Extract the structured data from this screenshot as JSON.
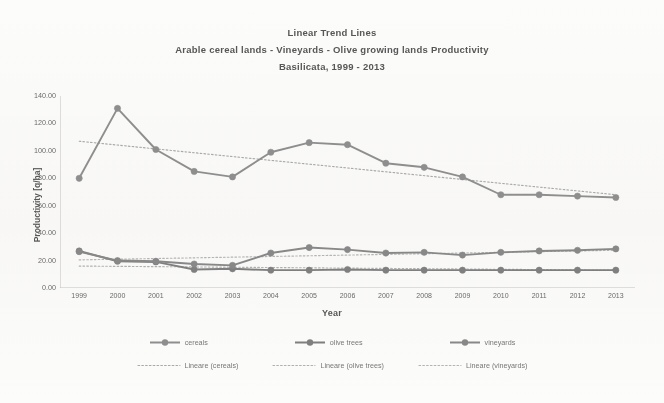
{
  "chart_data": {
    "type": "line",
    "title": "Linear Trend Lines",
    "subtitle_1": "Arable cereal lands - Vineyards - Olive growing lands Productivity",
    "subtitle_2": "Basilicata, 1999 - 2013",
    "xlabel": "Year",
    "ylabel": "Productivity  [q/ha]",
    "grid": false,
    "legend_position": "bottom",
    "ylim": [
      0,
      140
    ],
    "yticks": [
      0,
      20,
      40,
      60,
      80,
      100,
      120,
      140
    ],
    "ytick_labels": [
      "0.00",
      "20.00",
      "40.00",
      "60.00",
      "80.00",
      "100.00",
      "120.00",
      "140.00"
    ],
    "categories": [
      "1999",
      "2000",
      "2001",
      "2002",
      "2003",
      "2004",
      "2005",
      "2006",
      "2007",
      "2008",
      "2009",
      "2010",
      "2011",
      "2012",
      "2013"
    ],
    "series": [
      {
        "name": "cereals",
        "color": "#8e8e8e",
        "values": [
          80.0,
          131.0,
          101.0,
          85.0,
          81.0,
          99.0,
          106.0,
          104.5,
          91.0,
          88.0,
          81.0,
          68.0,
          68.0,
          67.0,
          66.0
        ]
      },
      {
        "name": "olive trees",
        "color": "#7f7f7f",
        "values": [
          27.0,
          19.5,
          19.0,
          13.5,
          14.0,
          13.0,
          13.0,
          13.5,
          13.0,
          13.0,
          13.0,
          13.0,
          13.0,
          13.0,
          13.0
        ]
      },
      {
        "name": "vineyards",
        "color": "#888888",
        "values": [
          26.5,
          20.0,
          19.5,
          17.5,
          16.5,
          25.5,
          29.5,
          28.0,
          25.5,
          26.0,
          24.0,
          26.0,
          27.0,
          27.5,
          28.5
        ]
      }
    ],
    "trendlines": [
      {
        "name": "Lineare (cereals)",
        "color": "#a9a9a9",
        "start_value": 107.0,
        "end_value": 68.0
      },
      {
        "name": "Lineare (olive trees)",
        "color": "#b0b0b0",
        "start_value": 16.0,
        "end_value": 13.0
      },
      {
        "name": "Lineare (vineyards)",
        "color": "#b4b4b4",
        "start_value": 20.5,
        "end_value": 27.5
      }
    ]
  },
  "legend": {
    "markers": [
      {
        "label": "cereals"
      },
      {
        "label": "olive trees"
      },
      {
        "label": "vineyards"
      }
    ],
    "trends": [
      {
        "label": "Lineare (cereals)"
      },
      {
        "label": "Lineare (olive trees)"
      },
      {
        "label": "Lineare (vineyards)"
      }
    ]
  }
}
